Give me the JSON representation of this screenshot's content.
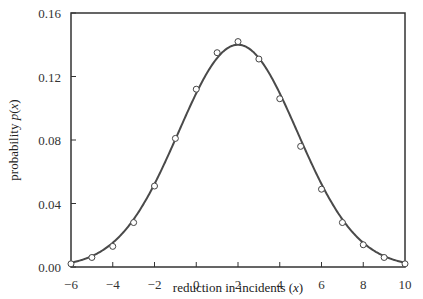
{
  "chart_data": {
    "type": "line",
    "title": "",
    "xlabel": "reduction in incidents (x)",
    "xlabel_parts": {
      "text": "reduction in incidents (",
      "var": "x",
      "close": ")"
    },
    "ylabel": "probability p(x)",
    "ylabel_parts": {
      "text": "probability ",
      "func": "p",
      "open": "(",
      "var": "x",
      "close": ")"
    },
    "xlim": [
      -6,
      10
    ],
    "ylim": [
      0,
      0.16
    ],
    "x_ticks": [
      -6,
      -4,
      -2,
      0,
      2,
      4,
      6,
      8,
      10
    ],
    "x_tick_labels": [
      "−6",
      "−4",
      "−2",
      "0",
      "2",
      "4",
      "6",
      "8",
      "10"
    ],
    "y_ticks": [
      0,
      0.04,
      0.08,
      0.12,
      0.16
    ],
    "y_tick_labels": [
      "0.00",
      "0.04",
      "0.08",
      "0.12",
      "0.16"
    ],
    "grid": false,
    "legend": null,
    "series": [
      {
        "name": "observed probabilities",
        "style": "open-circle markers",
        "x": [
          -6,
          -5,
          -4,
          -3,
          -2,
          -1,
          0,
          1,
          2,
          3,
          4,
          5,
          6,
          7,
          8,
          9,
          10
        ],
        "values": [
          0.002,
          0.006,
          0.013,
          0.028,
          0.051,
          0.081,
          0.112,
          0.135,
          0.142,
          0.131,
          0.106,
          0.076,
          0.049,
          0.028,
          0.014,
          0.006,
          0.002
        ]
      },
      {
        "name": "fitted normal curve",
        "style": "solid line",
        "mean": 2,
        "sd": 2.85
      }
    ]
  },
  "colors": {
    "line": "#4a4a4a",
    "axis": "#333333",
    "marker_fill": "#ffffff",
    "marker_stroke": "#444444"
  }
}
